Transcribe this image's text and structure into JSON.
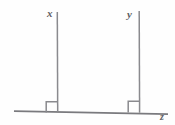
{
  "figure": {
    "type": "geometry-diagram",
    "canvas": {
      "width": 175,
      "height": 125,
      "background": "#fefefe"
    },
    "stroke_color": "#7a7a7e",
    "label_color": "#5f5f63",
    "labels": {
      "left_segment": "x",
      "right_segment": "y",
      "baseline": "z"
    },
    "elements": {
      "baseline": {
        "name": "z",
        "x1": 14,
        "y1": 111,
        "x2": 168,
        "y2": 114
      },
      "left_segment": {
        "name": "x",
        "x1": 57,
        "y1": 12,
        "x2": 57.5,
        "y2": 112
      },
      "right_segment": {
        "name": "y",
        "x1": 139,
        "y1": 11,
        "x2": 139.5,
        "y2": 112
      },
      "left_right_angle_mark": {
        "x": 46,
        "y": 102,
        "size": 11
      },
      "right_right_angle_mark": {
        "x": 128,
        "y": 101,
        "size": 11
      }
    }
  }
}
